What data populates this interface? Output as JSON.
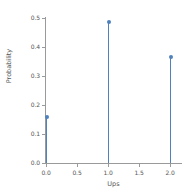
{
  "chart_data": {
    "type": "scatter",
    "plot_style": "stem",
    "title": "",
    "xlabel": "Ups",
    "ylabel": "Probability",
    "x": [
      0.0,
      1.0,
      2.0
    ],
    "values": [
      0.16,
      0.485,
      0.367
    ],
    "categories": [
      "0.0",
      "1.0",
      "2.0"
    ],
    "xlim": [
      -0.12,
      2.2
    ],
    "ylim": [
      0.0,
      0.52
    ],
    "xticks": [
      "0.0",
      "0.5",
      "1.0",
      "1.5",
      "2.0"
    ],
    "xtick_values": [
      0.0,
      0.5,
      1.0,
      1.5,
      2.0
    ],
    "yticks": [
      "0.0",
      "0.1",
      "0.2",
      "0.3",
      "0.4",
      "0.5"
    ],
    "ytick_values": [
      0.0,
      0.1,
      0.2,
      0.3,
      0.4,
      0.5
    ],
    "grid": false,
    "legend": false,
    "legend_position": "none",
    "series_color": "#4f81bd",
    "axis_color": "#9a9a9a",
    "tick_label_color": "#555555",
    "background_color": "#ffffff"
  }
}
